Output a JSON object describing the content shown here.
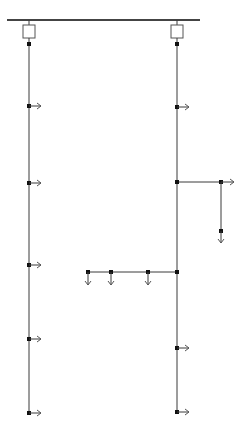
{
  "diagram": {
    "type": "single-line electrical distribution diagram",
    "colors": {
      "line": "#3a3a3a",
      "bus": "#444444",
      "box": "#555555",
      "node": "#111111",
      "arrow": "#555555"
    },
    "bus": {
      "x1": 7,
      "x2": 200,
      "y": 20
    },
    "feeders": [
      {
        "name": "left-feeder",
        "x": 29,
        "breaker": {
          "y": 25,
          "w": 12,
          "h": 13
        },
        "top_node_y": 44,
        "line_end_y": 413,
        "taps": [
          106,
          183,
          265,
          339,
          413
        ]
      },
      {
        "name": "right-feeder",
        "x": 177,
        "breaker": {
          "y": 25,
          "w": 12,
          "h": 13
        },
        "top_node_y": 44,
        "line_end_y": 412,
        "taps": [
          107,
          348,
          412
        ]
      }
    ],
    "branch_right": {
      "y": 182,
      "x_from": 177,
      "x_to": 221,
      "arrow_end_x": 234,
      "drop": {
        "x": 221,
        "node_y": 231,
        "arrow_end_y": 243
      }
    },
    "branch_left": {
      "y": 272,
      "x_from": 88,
      "x_to": 177,
      "nodes_x": [
        88,
        111,
        148
      ],
      "arrow_end_y": 285
    }
  }
}
